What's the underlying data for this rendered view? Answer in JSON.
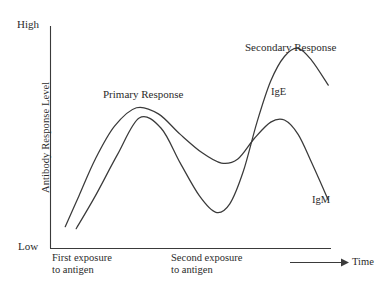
{
  "chart_data": {
    "type": "line",
    "title": "",
    "xlabel": "Time",
    "ylabel": "Antibody Response Level",
    "ylim_labels": [
      "Low",
      "High"
    ],
    "grid": false,
    "legend_position": "inline-annotations",
    "axis_style": "open-left-bottom-with-arrow",
    "annotations": [
      {
        "name": "primary-response",
        "text": "Primary Response"
      },
      {
        "name": "secondary-response",
        "text": "Secondary Response"
      },
      {
        "name": "first-exposure",
        "text": "First exposure\nto antigen"
      },
      {
        "name": "second-exposure",
        "text": "Second exposure\nto antigen"
      }
    ],
    "series": [
      {
        "name": "IgM",
        "label": "IgM",
        "description": "Rises after first exposure to a moderate primary peak, declines, rises again to a lower secondary peak, then falls.",
        "points": [
          [
            0.03,
            0.07
          ],
          [
            0.08,
            0.22
          ],
          [
            0.14,
            0.4
          ],
          [
            0.21,
            0.56
          ],
          [
            0.29,
            0.65
          ],
          [
            0.37,
            0.62
          ],
          [
            0.45,
            0.52
          ],
          [
            0.53,
            0.43
          ],
          [
            0.6,
            0.38
          ],
          [
            0.66,
            0.4
          ],
          [
            0.72,
            0.5
          ],
          [
            0.78,
            0.58
          ],
          [
            0.83,
            0.59
          ],
          [
            0.88,
            0.52
          ],
          [
            0.93,
            0.38
          ],
          [
            0.99,
            0.2
          ]
        ]
      },
      {
        "name": "IgE",
        "label": "IgE",
        "description": "Rises slowly after first exposure, dips to a trough, then rises steeply to a high secondary peak before declining.",
        "points": [
          [
            0.07,
            0.06
          ],
          [
            0.14,
            0.22
          ],
          [
            0.22,
            0.42
          ],
          [
            0.3,
            0.6
          ],
          [
            0.38,
            0.55
          ],
          [
            0.45,
            0.38
          ],
          [
            0.52,
            0.22
          ],
          [
            0.58,
            0.14
          ],
          [
            0.63,
            0.18
          ],
          [
            0.68,
            0.34
          ],
          [
            0.73,
            0.58
          ],
          [
            0.78,
            0.78
          ],
          [
            0.83,
            0.9
          ],
          [
            0.88,
            0.94
          ],
          [
            0.93,
            0.88
          ],
          [
            0.99,
            0.76
          ]
        ]
      }
    ]
  },
  "axes": {
    "high_label": "High",
    "low_label": "Low",
    "y_title": "Antibody Response Level",
    "x_title": "Time"
  },
  "labels": {
    "primary_response": "Primary Response",
    "secondary_response": "Secondary Response",
    "ige": "IgE",
    "igm": "IgM",
    "first_exposure": "First exposure\nto antigen",
    "second_exposure": "Second exposure\nto antigen"
  }
}
